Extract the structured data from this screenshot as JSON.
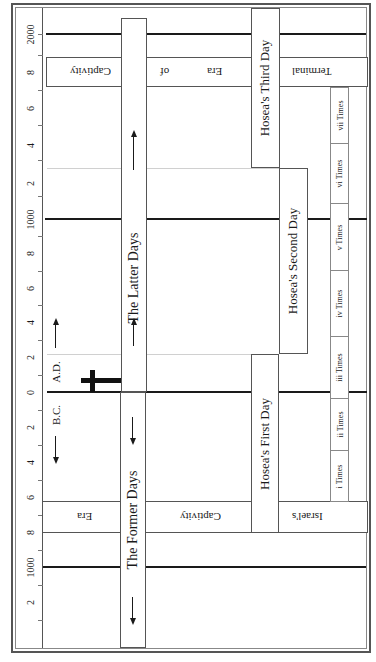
{
  "diagram": {
    "axis": {
      "ticks": [
        {
          "label": "2000",
          "y": 34
        },
        {
          "label": "8",
          "y": 72
        },
        {
          "label": "6",
          "y": 108
        },
        {
          "label": "4",
          "y": 145
        },
        {
          "label": "2",
          "y": 183
        },
        {
          "label": "1000",
          "y": 219
        },
        {
          "label": "8",
          "y": 253
        },
        {
          "label": "6",
          "y": 288
        },
        {
          "label": "4",
          "y": 322
        },
        {
          "label": "2",
          "y": 357
        },
        {
          "label": "0",
          "y": 392
        },
        {
          "label": "2",
          "y": 427
        },
        {
          "label": "4",
          "y": 462
        },
        {
          "label": "6",
          "y": 497
        },
        {
          "label": "8",
          "y": 532
        },
        {
          "label": "1000",
          "y": 567
        },
        {
          "label": "2",
          "y": 602
        }
      ],
      "era_labels": {
        "ad": "A.D.",
        "bc": "B.C."
      }
    },
    "bands": {
      "top": {
        "words": [
          "Captivity",
          "of",
          "Era",
          "Terminal"
        ]
      },
      "bottom": {
        "words": [
          "Era",
          "Captivity",
          "Israel's"
        ]
      }
    },
    "columns": {
      "latter_days": "The Latter Days",
      "former_days": "The Former Days",
      "hosea_first": "Hosea's First Day",
      "hosea_second": "Hosea's Second Day",
      "hosea_third": "Hosea's Third Day"
    },
    "times": [
      {
        "label": "vii Times"
      },
      {
        "label": "vi Times"
      },
      {
        "label": "v Times"
      },
      {
        "label": "iv Times"
      },
      {
        "label": "iii Times"
      },
      {
        "label": "ii Times"
      },
      {
        "label": "i Times"
      }
    ],
    "colors": {
      "line": "#1a1a1a",
      "border": "#555555",
      "background": "#ffffff"
    }
  }
}
